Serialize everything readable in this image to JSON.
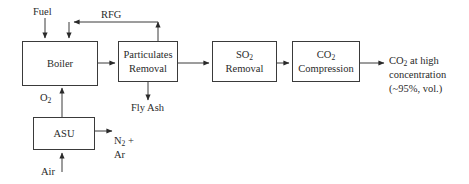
{
  "diagram": {
    "line_color": "#3a3a3a",
    "text_color": "#2a2a2a",
    "background": "#ffffff",
    "boxes": [
      {
        "id": "boiler",
        "label": "Boiler"
      },
      {
        "id": "particulates_removal",
        "label": "Particulates\nRemoval"
      },
      {
        "id": "so2_removal",
        "label": "SO2\nRemoval"
      },
      {
        "id": "co2_compression",
        "label": "CO2\nCompression"
      },
      {
        "id": "asu",
        "label": "ASU"
      }
    ],
    "stream_labels": [
      {
        "id": "fuel",
        "label": "Fuel"
      },
      {
        "id": "rfg",
        "label": "RFG"
      },
      {
        "id": "fly_ash",
        "label": "Fly Ash"
      },
      {
        "id": "o2",
        "label": "O2"
      },
      {
        "id": "air",
        "label": "Air"
      },
      {
        "id": "n2_ar",
        "label": "N2 +\nAr"
      },
      {
        "id": "co2_product",
        "label": "CO2 at high\nconcentration\n(~95%, vol.)"
      }
    ]
  }
}
